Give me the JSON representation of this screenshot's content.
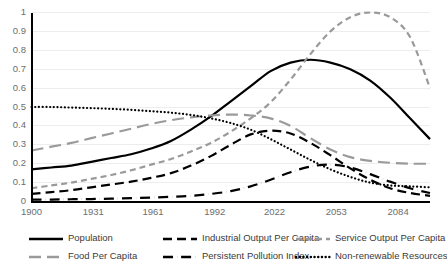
{
  "chart_data": {
    "type": "line",
    "title": "",
    "subtitle": "",
    "xlabel": "",
    "ylabel": "",
    "xlim": [
      1900,
      2100
    ],
    "ylim": [
      0,
      1
    ],
    "grid": "horizontal",
    "legend_position": "bottom",
    "x_ticks": [
      "1900",
      "1931",
      "1961",
      "1992",
      "2022",
      "2053",
      "2084"
    ],
    "x_tick_values": [
      1900,
      1931,
      1961,
      1992,
      2022,
      2053,
      2084
    ],
    "y_ticks": [
      "0",
      "0.1",
      "0.2",
      "0.3",
      "0.4",
      "0.5",
      "0.6",
      "0.7",
      "0.8",
      "0.9",
      "1"
    ],
    "y_tick_values": [
      0,
      0.1,
      0.2,
      0.3,
      0.4,
      0.5,
      0.6,
      0.7,
      0.8,
      0.9,
      1
    ],
    "x": [
      1900,
      1910,
      1920,
      1930,
      1940,
      1950,
      1960,
      1970,
      1980,
      1990,
      2000,
      2010,
      2020,
      2030,
      2040,
      2050,
      2060,
      2070,
      2080,
      2090,
      2100
    ],
    "series": [
      {
        "name": "Population",
        "style": "solid",
        "color": "#000000",
        "width": 2.2,
        "values": [
          0.17,
          0.18,
          0.19,
          0.21,
          0.23,
          0.25,
          0.28,
          0.32,
          0.38,
          0.45,
          0.53,
          0.61,
          0.69,
          0.735,
          0.75,
          0.735,
          0.7,
          0.64,
          0.55,
          0.44,
          0.33
        ]
      },
      {
        "name": "Food Per Capita",
        "style": "long-dash",
        "color": "#9a9a9a",
        "width": 2.2,
        "values": [
          0.27,
          0.29,
          0.31,
          0.335,
          0.36,
          0.385,
          0.41,
          0.43,
          0.445,
          0.455,
          0.46,
          0.455,
          0.44,
          0.4,
          0.335,
          0.275,
          0.235,
          0.215,
          0.205,
          0.2,
          0.2
        ]
      },
      {
        "name": "Industrial Output Per Capita",
        "style": "dash",
        "color": "#000000",
        "width": 2.2,
        "values": [
          0.04,
          0.05,
          0.06,
          0.075,
          0.09,
          0.105,
          0.125,
          0.15,
          0.19,
          0.24,
          0.3,
          0.355,
          0.375,
          0.36,
          0.31,
          0.245,
          0.175,
          0.115,
          0.07,
          0.045,
          0.03
        ]
      },
      {
        "name": "Persistent Pollution Index",
        "style": "dash-dot",
        "color": "#000000",
        "width": 2.2,
        "values": [
          0.01,
          0.01,
          0.012,
          0.013,
          0.015,
          0.018,
          0.021,
          0.025,
          0.03,
          0.04,
          0.055,
          0.08,
          0.115,
          0.155,
          0.185,
          0.195,
          0.18,
          0.145,
          0.105,
          0.07,
          0.045
        ]
      },
      {
        "name": "Service Output Per Capita",
        "style": "short-dash",
        "color": "#9a9a9a",
        "width": 2.2,
        "values": [
          0.07,
          0.085,
          0.1,
          0.12,
          0.14,
          0.165,
          0.195,
          0.225,
          0.265,
          0.31,
          0.37,
          0.44,
          0.525,
          0.645,
          0.78,
          0.9,
          0.975,
          1.0,
          0.975,
          0.87,
          0.6
        ]
      },
      {
        "name": "Non-renewable Resources",
        "style": "dot",
        "color": "#000000",
        "width": 2.2,
        "values": [
          0.5,
          0.5,
          0.497,
          0.494,
          0.49,
          0.485,
          0.478,
          0.47,
          0.458,
          0.44,
          0.415,
          0.38,
          0.33,
          0.275,
          0.22,
          0.17,
          0.13,
          0.1,
          0.085,
          0.08,
          0.075
        ]
      }
    ]
  },
  "legend": {
    "items": [
      {
        "label": "Population",
        "style": "solid",
        "color": "#000000"
      },
      {
        "label": "Industrial Output Per Capita",
        "style": "dash",
        "color": "#000000"
      },
      {
        "label": "Service Output Per Capita",
        "style": "short-dash",
        "color": "#9a9a9a"
      },
      {
        "label": "Food Per Capita",
        "style": "long-dash",
        "color": "#9a9a9a"
      },
      {
        "label": "Persistent Pollution Index",
        "style": "dash-dot",
        "color": "#000000"
      },
      {
        "label": "Non-renewable Resources",
        "style": "dot",
        "color": "#000000"
      }
    ]
  },
  "colors": {
    "axis": "#000000",
    "gridline": "#ededed",
    "tick_text": "#6e6e6e",
    "legend_text": "#3b3b3b",
    "series_black": "#000000",
    "series_gray": "#9a9a9a",
    "background": "#ffffff"
  }
}
